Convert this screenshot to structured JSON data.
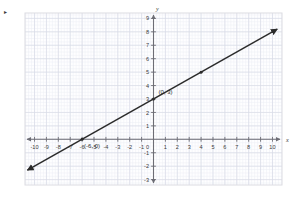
{
  "figure": {
    "background_color": "#ffffff",
    "plot_background_color": "#fefeff",
    "border_color": "#dcdce2",
    "grid_major_color": "#d9dbe6",
    "grid_minor_color": "#eceef4",
    "axis_color": "#6d6d75",
    "line_color": "#2b2b2b",
    "stray_mark": "▸"
  },
  "chart_data": {
    "type": "line",
    "title": "",
    "xlabel": "x",
    "ylabel": "y",
    "xlim": [
      -10.8,
      10.8
    ],
    "ylim": [
      -3.4,
      9.4
    ],
    "grid": true,
    "grid_minor_step": 0.25,
    "grid_major_step": 1,
    "legend": "none",
    "x_ticks": [
      -10,
      -9,
      -8,
      -7,
      -6,
      -5,
      -4,
      -3,
      -2,
      -1,
      1,
      2,
      3,
      4,
      5,
      6,
      7,
      8,
      9,
      10
    ],
    "x_tick_labels": [
      "-10",
      "-9",
      "-8",
      "-7",
      "-6",
      "-5",
      "-4",
      "-3",
      "-2",
      "-1",
      "1",
      "2",
      "3",
      "4",
      "5",
      "6",
      "7",
      "8",
      "9",
      "10"
    ],
    "y_ticks": [
      9,
      8,
      7,
      6,
      5,
      4,
      3,
      2,
      1,
      -1,
      -2,
      -3
    ],
    "y_tick_labels": [
      "9",
      "8",
      "7",
      "6",
      "5",
      "4",
      "3",
      "2",
      "1",
      "-1",
      "-2",
      "-3"
    ],
    "origin_label": "0",
    "series": [
      {
        "name": "line",
        "kind": "line",
        "equation": "y = 0.5x + 3",
        "slope": 0.5,
        "intercept": 3,
        "x": [
          -10.6,
          10.4
        ],
        "y": [
          -2.3,
          8.2
        ],
        "arrow_start": true,
        "arrow_end": true,
        "points": [
          {
            "x": -6,
            "y": 0,
            "label": "(-6, 0)",
            "marker": true
          },
          {
            "x": 0,
            "y": 3,
            "label": "(0, 3)",
            "marker": true
          },
          {
            "x": 4,
            "y": 5,
            "label": "",
            "marker": true
          }
        ]
      }
    ],
    "annotations": [
      {
        "text": "(-6, 0)",
        "x": -6,
        "y": 0,
        "dx": 2,
        "dy": 9
      },
      {
        "text": "(0, 3)",
        "x": 0,
        "y": 3,
        "dx": 5,
        "dy": -5
      }
    ]
  }
}
